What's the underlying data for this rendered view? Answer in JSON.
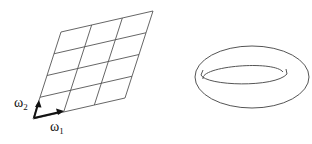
{
  "figure": {
    "left_panel": {
      "description": "lattice grid (parallelogram) spanned by periods",
      "grid": {
        "columns": 3,
        "rows": 4
      },
      "vectors": [
        {
          "symbol": "ω",
          "subscript": "1"
        },
        {
          "symbol": "ω",
          "subscript": "2"
        }
      ]
    },
    "right_panel": {
      "description": "torus"
    }
  },
  "colors": {
    "line": "#444444",
    "vector": "#111111",
    "background": "#ffffff"
  }
}
